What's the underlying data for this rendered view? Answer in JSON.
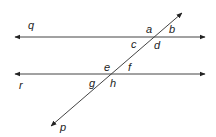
{
  "diagram": {
    "lines": [
      {
        "name": "q",
        "label": "q",
        "type": "parallel",
        "y": 37,
        "x1": 15,
        "x2": 205
      },
      {
        "name": "r",
        "label": "r",
        "type": "parallel",
        "y": 74,
        "x1": 15,
        "x2": 205
      },
      {
        "name": "p",
        "label": "p",
        "type": "transversal",
        "x1": 182,
        "y1": 13,
        "x2": 51,
        "y2": 126
      }
    ],
    "angles": {
      "a": "a",
      "b": "b",
      "c": "c",
      "d": "d",
      "e": "e",
      "f": "f",
      "g": "g",
      "h": "h"
    },
    "line_labels": {
      "q": "q",
      "r": "r",
      "p": "p"
    },
    "colors": {
      "line": "#333333",
      "text": "#222222",
      "background": "#ffffff"
    }
  }
}
